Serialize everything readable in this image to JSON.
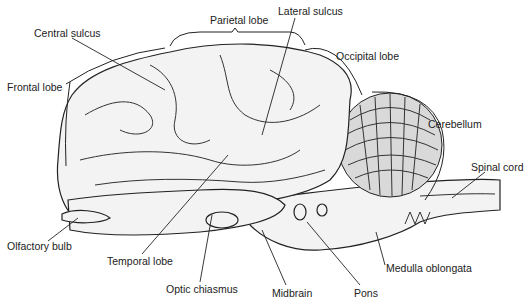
{
  "figure": {
    "labels": {
      "parietal_lobe": "Parietal lobe",
      "lateral_sulcus": "Lateral sulcus",
      "central_sulcus": "Central sulcus",
      "occipital_lobe": "Occipital lobe",
      "frontal_lobe": "Frontal lobe",
      "cerebellum": "Cerebellum",
      "spinal_cord": "Spinal cord",
      "olfactory_bulb": "Olfactory bulb",
      "temporal_lobe": "Temporal lobe",
      "medulla_oblongata": "Medulla oblongata",
      "optic_chiasmus": "Optic chiasmus",
      "midbrain": "Midbrain",
      "pons": "Pons"
    }
  }
}
